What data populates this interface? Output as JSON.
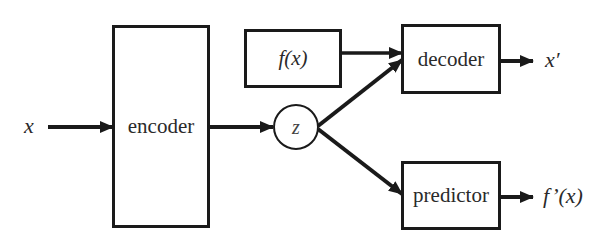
{
  "diagram": {
    "type": "block-diagram",
    "nodes": {
      "input_x": "x",
      "encoder": "encoder",
      "latent_z": "z",
      "fx": "f(x)",
      "decoder": "decoder",
      "predictor": "predictor",
      "output_x_prime": "x′",
      "output_f_prime": "f’(x)"
    },
    "edges": [
      {
        "from": "x",
        "to": "encoder"
      },
      {
        "from": "encoder",
        "to": "z"
      },
      {
        "from": "f(x)",
        "to": "decoder"
      },
      {
        "from": "z",
        "to": "decoder"
      },
      {
        "from": "z",
        "to": "predictor"
      },
      {
        "from": "decoder",
        "to": "x′"
      },
      {
        "from": "predictor",
        "to": "f’(x)"
      }
    ],
    "colors": {
      "stroke": "#1a1a1a",
      "text": "#2a2a2a",
      "background": "#ffffff"
    }
  }
}
